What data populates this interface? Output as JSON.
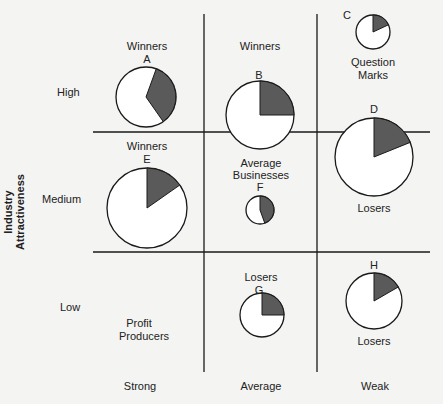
{
  "chart_data": {
    "type": "matrix-bubble-pie",
    "title": "",
    "ylabel": "Industry Attractiveness",
    "xlabel": "",
    "rows": [
      "High",
      "Medium",
      "Low"
    ],
    "columns": [
      "Strong",
      "Average",
      "Weak"
    ],
    "cell_labels": [
      {
        "row": "High",
        "col": "Strong",
        "label": "Winners"
      },
      {
        "row": "High",
        "col": "Average",
        "label": "Winners"
      },
      {
        "row": "High",
        "col": "Weak",
        "label": "Question Marks"
      },
      {
        "row": "Medium",
        "col": "Strong",
        "label": "Winners"
      },
      {
        "row": "Medium",
        "col": "Average",
        "label": "Average Businesses"
      },
      {
        "row": "Medium",
        "col": "Weak",
        "label": "Losers"
      },
      {
        "row": "Low",
        "col": "Strong",
        "label": "Profit Producers"
      },
      {
        "row": "Low",
        "col": "Average",
        "label": "Losers"
      },
      {
        "row": "Low",
        "col": "Weak",
        "label": "Losers"
      }
    ],
    "businesses": [
      {
        "id": "A",
        "row": "High",
        "col": "Strong",
        "relative_size": 30,
        "share_start_deg": 20,
        "share_end_deg": 145
      },
      {
        "id": "B",
        "row": "High",
        "col": "Average",
        "relative_size": 34,
        "share_start_deg": 0,
        "share_end_deg": 90
      },
      {
        "id": "C",
        "row": "High",
        "col": "Weak",
        "relative_size": 17,
        "share_start_deg": 0,
        "share_end_deg": 65
      },
      {
        "id": "D",
        "row": "Medium",
        "col": "Weak",
        "relative_size": 39,
        "share_start_deg": 0,
        "share_end_deg": 68
      },
      {
        "id": "E",
        "row": "Medium",
        "col": "Strong",
        "relative_size": 40,
        "share_start_deg": 0,
        "share_end_deg": 55
      },
      {
        "id": "F",
        "row": "Medium",
        "col": "Average",
        "relative_size": 14,
        "share_start_deg": 0,
        "share_end_deg": 160
      },
      {
        "id": "G",
        "row": "Low",
        "col": "Average",
        "relative_size": 22,
        "share_start_deg": 0,
        "share_end_deg": 90
      },
      {
        "id": "H",
        "row": "Low",
        "col": "Weak",
        "relative_size": 28,
        "share_start_deg": 0,
        "share_end_deg": 60
      }
    ]
  },
  "labels": {
    "y_axis": "Industry Attractiveness",
    "rows": {
      "high": "High",
      "medium": "Medium",
      "low": "Low"
    },
    "cols": {
      "strong": "Strong",
      "average": "Average",
      "weak": "Weak"
    },
    "winners_a": "Winners",
    "a": "A",
    "winners_b": "Winners",
    "b": "B",
    "c": "C",
    "qm1": "Question",
    "qm2": "Marks",
    "d": "D",
    "winners_e": "Winners",
    "e": "E",
    "avg1": "Average",
    "avg2": "Businesses",
    "f": "F",
    "losers_d": "Losers",
    "losers_g": "Losers",
    "g": "G",
    "h": "H",
    "losers_h": "Losers",
    "pp1": "Profit",
    "pp2": "Producers"
  },
  "colors": {
    "shade": "#5a5a5a",
    "line": "#1a1a1a",
    "fill": "#ffffff"
  }
}
